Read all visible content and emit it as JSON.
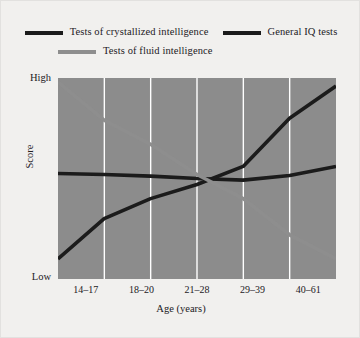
{
  "chart_data": {
    "type": "line",
    "title": "",
    "subtitle": "",
    "xlabel": "Age (years)",
    "ylabel": "Score",
    "categories": [
      "14–17",
      "18–20",
      "21–28",
      "29–39",
      "40–61"
    ],
    "ytick_labels": [
      "High",
      "Low"
    ],
    "ylim": [
      0,
      1
    ],
    "yaxis_note": "Qualitative scale: Low at bottom, High at top; no numeric ticks",
    "grid": "vertical white gridlines at each category boundary",
    "legend_position": "top, outside plot, two rows",
    "plot_background": "#8c8c8c",
    "gridline_color": "#ffffff",
    "series": [
      {
        "name": "Tests of crystallized intelligence",
        "color": "#1b1b1b",
        "x": [
          0.0,
          0.166,
          0.333,
          0.5,
          0.666,
          0.833,
          1.0
        ],
        "values": [
          0.1,
          0.3,
          0.4,
          0.47,
          0.56,
          0.8,
          0.96
        ]
      },
      {
        "name": "General IQ tests",
        "color": "#1b1b1b",
        "x": [
          0.0,
          0.166,
          0.333,
          0.5,
          0.666,
          0.833,
          1.0
        ],
        "values": [
          0.525,
          0.52,
          0.512,
          0.5,
          0.492,
          0.515,
          0.56
        ]
      },
      {
        "name": "Tests of fluid intelligence",
        "color": "#8e8e8e",
        "x": [
          0.0,
          0.166,
          0.333,
          0.5,
          0.666,
          0.833,
          1.0
        ],
        "values": [
          0.98,
          0.79,
          0.67,
          0.52,
          0.4,
          0.22,
          0.1
        ]
      }
    ]
  },
  "legend": {
    "row1": [
      {
        "label": "Tests of crystallized intelligence",
        "swatch": "dark"
      },
      {
        "label": "General IQ tests",
        "swatch": "dark"
      }
    ],
    "row2": [
      {
        "label": "Tests of fluid intelligence",
        "swatch": "light"
      }
    ]
  },
  "axes": {
    "y_high": "High",
    "y_low": "Low",
    "y_title": "Score",
    "x_title": "Age (years)",
    "x_ticks": [
      "14–17",
      "18–20",
      "21–28",
      "29–39",
      "40–61"
    ]
  },
  "colors": {
    "figure_background": "#f1f0ee",
    "plot_background": "#8c8c8c",
    "gridline": "#ffffff",
    "dark_series": "#1b1b1b",
    "light_series": "#8e8e8e",
    "text": "#23201e"
  }
}
